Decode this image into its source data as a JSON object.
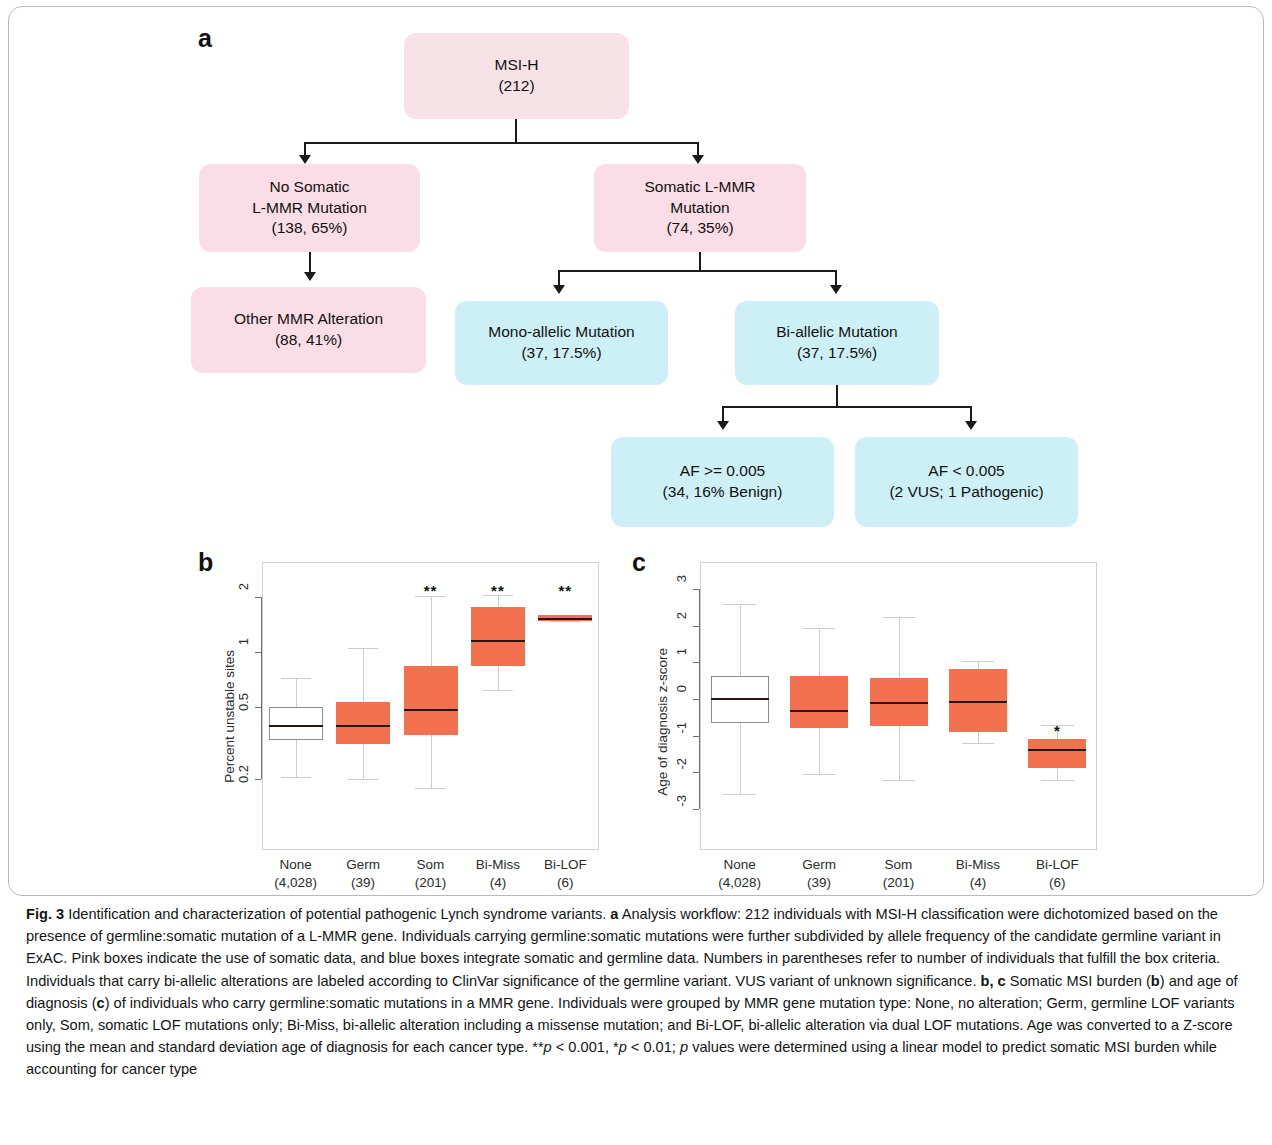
{
  "figure": {
    "panels": {
      "a": "a",
      "b": "b",
      "c": "c"
    }
  },
  "flowchart": {
    "nodes": [
      {
        "id": "msi-h",
        "style": "pink-light",
        "line1": "MSI-H",
        "line2": "(212)"
      },
      {
        "id": "no-somatic",
        "style": "pink",
        "line1": "No Somatic",
        "line2": "L-MMR Mutation",
        "line3": "(138, 65%)"
      },
      {
        "id": "somatic",
        "style": "pink",
        "line1": "Somatic L-MMR",
        "line2": "Mutation",
        "line3": "(74, 35%)"
      },
      {
        "id": "other-mmr",
        "style": "pink",
        "line1": "Other MMR Alteration",
        "line2": "(88, 41%)"
      },
      {
        "id": "mono-allelic",
        "style": "blue",
        "line1": "Mono-allelic Mutation",
        "line2": "(37, 17.5%)"
      },
      {
        "id": "bi-allelic",
        "style": "blue",
        "line1": "Bi-allelic Mutation",
        "line2": "(37, 17.5%)"
      },
      {
        "id": "af-high",
        "style": "blue",
        "line1": "AF >= 0.005",
        "line2": "(34, 16% Benign)"
      },
      {
        "id": "af-low",
        "style": "blue",
        "line1": "AF < 0.005",
        "line2": "(2 VUS; 1 Pathogenic)"
      }
    ],
    "colors": {
      "pink_light": "#f7e2e8",
      "pink": "#fadde6",
      "blue": "#cdf0f6",
      "connector": "#1a1a1a"
    }
  },
  "chart_data": [
    {
      "id": "panel-b",
      "type": "box",
      "title": "",
      "ylabel": "Percent unstable sites",
      "xlabel": "",
      "yscale": "log",
      "yticks": [
        0.2,
        0.5,
        1,
        2
      ],
      "ytick_labels": [
        "0.2",
        "0.5",
        "1",
        "2"
      ],
      "ylim": [
        0.15,
        2.6
      ],
      "grid": false,
      "categories": [
        "None",
        "Germ",
        "Som",
        "Bi-Miss",
        "Bi-LOF"
      ],
      "category_counts": [
        "(4,028)",
        "(39)",
        "(201)",
        "(4)",
        "(6)"
      ],
      "boxes": [
        {
          "name": "None",
          "q1": 0.33,
          "median": 0.39,
          "q3": 0.5,
          "whisker_low": 0.205,
          "whisker_high": 0.72,
          "fill": "white",
          "significance": ""
        },
        {
          "name": "Germ",
          "q1": 0.31,
          "median": 0.39,
          "q3": 0.53,
          "whisker_low": 0.2,
          "whisker_high": 1.05,
          "fill": "orange",
          "significance": ""
        },
        {
          "name": "Som",
          "q1": 0.35,
          "median": 0.48,
          "q3": 0.83,
          "whisker_low": 0.18,
          "whisker_high": 2.02,
          "fill": "orange",
          "significance": "**"
        },
        {
          "name": "Bi-Miss",
          "q1": 0.83,
          "median": 1.15,
          "q3": 1.75,
          "whisker_low": 0.62,
          "whisker_high": 2.05,
          "fill": "orange",
          "significance": "**"
        },
        {
          "name": "Bi-LOF",
          "q1": 1.47,
          "median": 1.52,
          "q3": 1.58,
          "whisker_low": 1.47,
          "whisker_high": 1.58,
          "fill": "orange",
          "significance": "**"
        }
      ]
    },
    {
      "id": "panel-c",
      "type": "box",
      "title": "",
      "ylabel": "Age of diagnosis z-score",
      "xlabel": "",
      "yscale": "linear",
      "yticks": [
        3,
        2,
        1,
        0,
        -1,
        -2,
        -3
      ],
      "ytick_labels": [
        "3",
        "2",
        "1",
        "0",
        "-1",
        "-2",
        "-3"
      ],
      "ylim": [
        -3.3,
        3.3
      ],
      "grid": false,
      "categories": [
        "None",
        "Germ",
        "Som",
        "Bi-Miss",
        "Bi-LOF"
      ],
      "category_counts": [
        "(4,028)",
        "(39)",
        "(201)",
        "(4)",
        "(6)"
      ],
      "boxes": [
        {
          "name": "None",
          "q1": -0.65,
          "median": 0.0,
          "q3": 0.63,
          "whisker_low": -2.6,
          "whisker_high": 2.6,
          "fill": "white",
          "significance": ""
        },
        {
          "name": "Germ",
          "q1": -0.8,
          "median": -0.32,
          "q3": 0.62,
          "whisker_low": -2.05,
          "whisker_high": 1.95,
          "fill": "orange",
          "significance": ""
        },
        {
          "name": "Som",
          "q1": -0.75,
          "median": -0.12,
          "q3": 0.57,
          "whisker_low": -2.2,
          "whisker_high": 2.25,
          "fill": "orange",
          "significance": ""
        },
        {
          "name": "Bi-Miss",
          "q1": -0.9,
          "median": -0.09,
          "q3": 0.82,
          "whisker_low": -1.2,
          "whisker_high": 1.05,
          "fill": "orange",
          "significance": ""
        },
        {
          "name": "Bi-LOF",
          "q1": -1.87,
          "median": -1.4,
          "q3": -1.1,
          "whisker_low": -2.2,
          "whisker_high": -0.72,
          "fill": "orange",
          "significance": "*"
        }
      ]
    }
  ],
  "caption": {
    "label": "Fig. 3",
    "text_1": " Identification and characterization of potential pathogenic Lynch syndrome variants. ",
    "a_label": "a",
    "text_2": " Analysis workflow: 212 individuals with MSI-H classification were dichotomized based on the presence of germline:somatic mutation of a L-MMR gene. Individuals carrying germline:somatic mutations were further subdivided by allele frequency of the candidate germline variant in ExAC. Pink boxes indicate the use of somatic data, and blue boxes integrate somatic and germline data. Numbers in parentheses refer to number of individuals that fulfill the box criteria. Individuals that carry bi-allelic alterations are labeled according to ClinVar significance of the germline variant. VUS variant of unknown significance. ",
    "bc_label": "b, c",
    "text_3": " Somatic MSI burden (",
    "b_label": "b",
    "text_4": ") and age of diagnosis (",
    "c_label": "c",
    "text_5": ") of individuals who carry germline:somatic mutations in a MMR gene. Individuals were grouped by MMR gene mutation type: None, no alteration; Germ, germline LOF variants only, Som, somatic LOF mutations only; Bi-Miss, bi-allelic alteration including a missense mutation; and Bi-LOF, bi-allelic alteration via dual LOF mutations. Age was converted to a Z-score using the mean and standard deviation age of diagnosis for each cancer type. **",
    "p_italic_1": "p",
    "text_6": " < 0.001, *",
    "p_italic_2": "p",
    "text_7": " < 0.01; ",
    "p_italic_3": "p",
    "text_8": " values were determined using a linear model to predict somatic MSI burden while accounting for cancer type"
  }
}
